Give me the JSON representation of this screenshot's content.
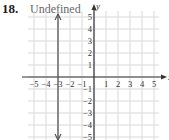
{
  "problem": {
    "number": "18.",
    "answer": "Undefined"
  },
  "chart_data": {
    "type": "line",
    "title": "Undefined",
    "xlabel": "x",
    "ylabel": "y",
    "xlim": [
      -5,
      5
    ],
    "ylim": [
      -5,
      5
    ],
    "grid": true,
    "x_ticks": [
      "-5",
      "-4",
      "-3",
      "-2",
      "-1",
      "1",
      "2",
      "3",
      "4",
      "5"
    ],
    "y_ticks": [
      "5",
      "4",
      "3",
      "2",
      "1",
      "-1",
      "-2",
      "-3",
      "-4",
      "-5"
    ],
    "series": [
      {
        "name": "vertical line x = -3",
        "equation": "x = -3",
        "slope": "undefined",
        "points": [
          [
            -3,
            -5
          ],
          [
            -3,
            5
          ]
        ],
        "arrows": "both ends"
      }
    ],
    "colors": {
      "grid": "#d9d9d9",
      "axis": "#333333",
      "line": "#555555"
    }
  }
}
